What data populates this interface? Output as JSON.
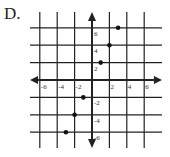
{
  "option_label": "D.",
  "chart_data": {
    "type": "scatter",
    "title": "",
    "xlabel": "",
    "ylabel": "",
    "xlim": [
      -7,
      7
    ],
    "ylim": [
      -7,
      7
    ],
    "grid": true,
    "grid_step": 2,
    "x_tick_labels": [
      "-6",
      "-4",
      "-2",
      "2",
      "4",
      "6"
    ],
    "y_tick_labels": [
      "6",
      "4",
      "2",
      "-2",
      "-4",
      "-6"
    ],
    "x_ticks": [
      -6,
      -4,
      -2,
      2,
      4,
      6
    ],
    "y_ticks": [
      6,
      4,
      2,
      -2,
      -4,
      -6
    ],
    "points": [
      {
        "x": -3,
        "y": -6
      },
      {
        "x": -2,
        "y": -4
      },
      {
        "x": -1,
        "y": -2
      },
      {
        "x": 1,
        "y": 2
      },
      {
        "x": 2,
        "y": 4
      },
      {
        "x": 3,
        "y": 6
      }
    ],
    "colors": {
      "line": "#222222",
      "point": "#111111"
    }
  }
}
